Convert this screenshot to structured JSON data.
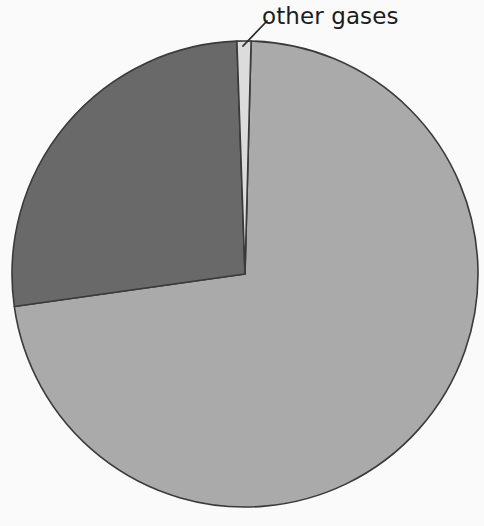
{
  "chart_data": {
    "type": "pie",
    "title": "",
    "subtitle": "",
    "xlabel": "",
    "ylabel": "",
    "legend_position": "none",
    "grid": false,
    "categories": [
      "nitrogen",
      "oxygen",
      "other gases"
    ],
    "values": [
      78,
      21,
      1
    ],
    "units": "percent",
    "start_angle_deg": 0,
    "direction": "clockwise",
    "slices": [
      {
        "label": "",
        "visible_label": "",
        "value": 78,
        "color": "#aaaaaa",
        "start_angle_deg": 1.5,
        "end_angle_deg": 262.0,
        "labeled": false
      },
      {
        "label": "",
        "visible_label": "",
        "value": 21,
        "color": "#696969",
        "start_angle_deg": 262.0,
        "end_angle_deg": 358.0,
        "labeled": false
      },
      {
        "label": "other gases",
        "visible_label": "other gases",
        "value": 1,
        "color": "#dcdcdc",
        "start_angle_deg": 358.0,
        "end_angle_deg": 1.5,
        "labeled": true
      }
    ],
    "annotations": [
      {
        "text": "other gases",
        "text_x": 262,
        "text_y": 24,
        "leader_from_x": 243,
        "leader_from_y": 46,
        "leader_to_x": 267,
        "leader_to_y": 21
      }
    ],
    "geometry": {
      "center_x": 245,
      "center_y": 274,
      "radius": 233
    },
    "colors": {
      "background": "#fafafa",
      "outline": "#3a3a3a",
      "text": "#1c1c1c",
      "slice_large": "#aaaaaa",
      "slice_dark": "#696969",
      "slice_thin": "#dcdcdc"
    }
  }
}
